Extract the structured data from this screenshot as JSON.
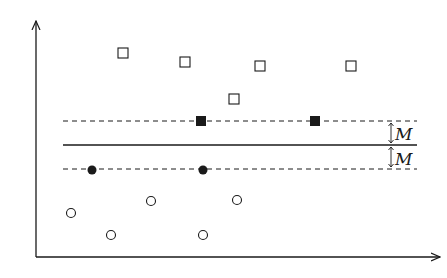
{
  "diagram": {
    "type": "svm-margin-illustration",
    "margin_label_upper": "M",
    "margin_label_lower": "M",
    "colors": {
      "ink": "#1a1a1a",
      "background": "#ffffff"
    },
    "axes": {
      "x_axis": "arrow",
      "y_axis": "arrow",
      "tick_labels": []
    },
    "lines": [
      {
        "name": "upper-margin",
        "style": "dashed",
        "y": 121
      },
      {
        "name": "decision-boundary",
        "style": "solid",
        "y": 145
      },
      {
        "name": "lower-margin",
        "style": "dashed",
        "y": 169
      }
    ],
    "points": {
      "open_squares": [
        [
          123,
          53
        ],
        [
          185,
          62
        ],
        [
          260,
          66
        ],
        [
          351,
          66
        ],
        [
          234,
          99
        ]
      ],
      "support_squares": [
        [
          201,
          121
        ],
        [
          315,
          121
        ]
      ],
      "support_circles": [
        [
          92,
          170
        ],
        [
          203,
          170
        ]
      ],
      "open_circles": [
        [
          71,
          213
        ],
        [
          151,
          201
        ],
        [
          237,
          200
        ],
        [
          111,
          235
        ],
        [
          203,
          235
        ]
      ]
    }
  }
}
